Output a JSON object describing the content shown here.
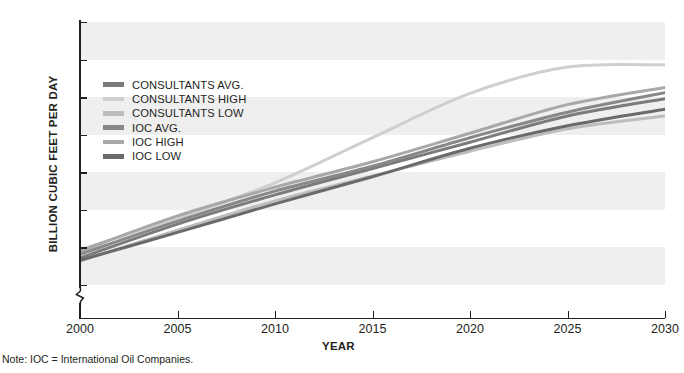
{
  "chart_data": {
    "type": "line",
    "title": "",
    "xlabel": "YEAR",
    "ylabel": "BILLION CUBIC FEET PER DAY",
    "note": "Note: IOC = International Oil Companies.",
    "xlim": [
      2000,
      2030
    ],
    "ylim": [
      180,
      550
    ],
    "y_axis_break": true,
    "y_zero_tick": "0",
    "grid": "horizontal-bands",
    "legend_position": "inside-upper-left",
    "xticks": [
      "2000",
      "2005",
      "2010",
      "2015",
      "2020",
      "2025",
      "2030"
    ],
    "xtick_values": [
      2000,
      2005,
      2010,
      2015,
      2020,
      2025,
      2030
    ],
    "yticks": [
      "0",
      "200",
      "250",
      "300",
      "350",
      "400",
      "450",
      "500",
      "550"
    ],
    "ytick_values": [
      200,
      250,
      300,
      350,
      400,
      450,
      500,
      550
    ],
    "x": [
      2000,
      2005,
      2010,
      2015,
      2020,
      2025,
      2030
    ],
    "series": [
      {
        "name": "CONSULTANTS AVG.",
        "color": "#7b7b7b",
        "width": 3.0,
        "values": [
          236,
          281,
          320,
          355,
          390,
          425,
          448
        ]
      },
      {
        "name": "CONSULTANTS HIGH",
        "color": "#cfcfcf",
        "width": 3.0,
        "values": [
          247,
          289,
          336,
          396,
          455,
          490,
          493
        ]
      },
      {
        "name": "CONSULTANTS LOW",
        "color": "#bdbdbd",
        "width": 3.0,
        "values": [
          232,
          273,
          312,
          345,
          378,
          408,
          425
        ]
      },
      {
        "name": "IOC AVG.",
        "color": "#888888",
        "width": 3.0,
        "values": [
          241,
          285,
          325,
          358,
          396,
          430,
          456
        ]
      },
      {
        "name": "IOC HIGH",
        "color": "#a8a8a8",
        "width": 3.0,
        "values": [
          245,
          292,
          330,
          364,
          402,
          440,
          463
        ]
      },
      {
        "name": "IOC LOW",
        "color": "#6a6a6a",
        "width": 3.0,
        "values": [
          233,
          270,
          308,
          344,
          382,
          412,
          434
        ]
      }
    ],
    "bands": [
      {
        "from": 500,
        "to": 550
      },
      {
        "from": 400,
        "to": 450
      },
      {
        "from": 300,
        "to": 350
      },
      {
        "from": 200,
        "to": 250
      }
    ]
  }
}
